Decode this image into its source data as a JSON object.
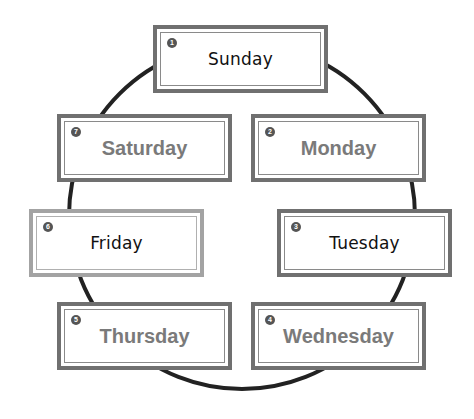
{
  "diagram": {
    "ring": {
      "cx": 242,
      "cy": 216,
      "r": 173,
      "stroke": "#222222",
      "stroke_width": 4
    },
    "days": [
      {
        "num": "1",
        "label": "Sunday",
        "style": "plain"
      },
      {
        "num": "2",
        "label": "Monday",
        "style": "bold"
      },
      {
        "num": "3",
        "label": "Tuesday",
        "style": "plain"
      },
      {
        "num": "4",
        "label": "Wednesday",
        "style": "bold"
      },
      {
        "num": "5",
        "label": "Thursday",
        "style": "bold"
      },
      {
        "num": "6",
        "label": "Friday",
        "style": "plain"
      },
      {
        "num": "7",
        "label": "Saturday",
        "style": "bold"
      }
    ]
  }
}
